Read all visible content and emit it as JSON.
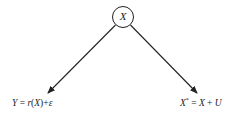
{
  "diagram": {
    "type": "directed-graph",
    "nodes": [
      {
        "id": "X",
        "label": "X",
        "shape": "circle"
      }
    ],
    "edges": [
      {
        "from": "X",
        "to": "Y",
        "label": ""
      },
      {
        "from": "X",
        "to": "X*",
        "label": ""
      }
    ],
    "root": {
      "label": "X"
    },
    "left_child": {
      "lhs": "Y",
      "eq": "=",
      "func": "r",
      "arg_open": "(",
      "arg": "X",
      "arg_close": ")",
      "plus": "+",
      "noise": "ε",
      "full_text": "Y = r(X)+ε"
    },
    "right_child": {
      "lhs": "X",
      "sup": "*",
      "eq": "=",
      "var": "X",
      "plus": "+",
      "noise": "U",
      "full_text": "X* = X + U"
    }
  },
  "colors": {
    "line": "#222222",
    "background": "#ffffff"
  }
}
